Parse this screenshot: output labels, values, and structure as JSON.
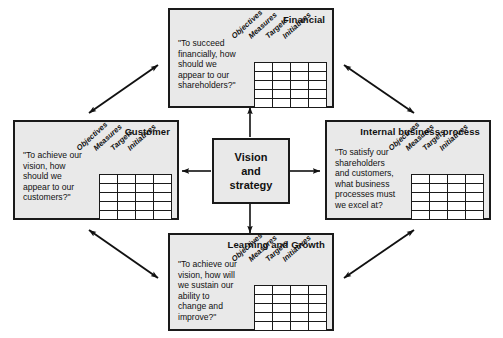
{
  "diagram": {
    "center": {
      "name": "vision-and-strategy",
      "lines": [
        "Vision",
        "and",
        "strategy"
      ]
    },
    "column_headers": [
      "Objectives",
      "Measures",
      "Targets",
      "Initiatives"
    ],
    "grid_rows": 5,
    "grid_cols": 4,
    "perspectives": [
      {
        "id": "financial",
        "title": "Financial",
        "question": "\"To succeed\nfinancially, how\nshould we\nappear to our\nshareholders?\""
      },
      {
        "id": "customer",
        "title": "Customer",
        "question": "\"To achieve our\nvision, how\nshould we\nappear to our\ncustomers?\""
      },
      {
        "id": "internal-business-process",
        "title": "Internal business process",
        "question": "\"To satisfy our\nshareholders\nand customers,\nwhat business\nprocesses must\nwe excel at?"
      },
      {
        "id": "learning-and-growth",
        "title": "Learning and Growth",
        "question": "\"To achieve our\nvision, how will\nwe sustain our\nability to\nchange and\nimprove?\""
      }
    ],
    "colors": {
      "box_fill": "#e9e9e9",
      "cell_fill": "#ffffff",
      "stroke": "#1a1a1a",
      "page_background": "#ffffff"
    },
    "connectors": {
      "center_to_perspective": "single-headed arrow",
      "perspective_to_perspective": "double-headed arrow"
    }
  }
}
